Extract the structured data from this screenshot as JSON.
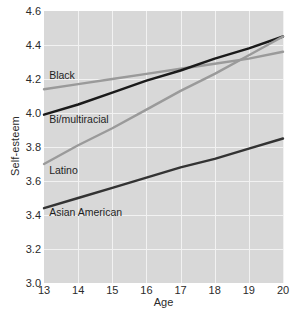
{
  "chart_data": {
    "type": "line",
    "title": "",
    "xlabel": "Age",
    "ylabel": "Self-esteem",
    "x": [
      13,
      14,
      15,
      16,
      17,
      18,
      19,
      20
    ],
    "xlim": [
      13,
      20
    ],
    "ylim": [
      3.0,
      4.6
    ],
    "yticks": [
      "4.6",
      "4.4",
      "4.2",
      "4.0",
      "3.8",
      "3.6",
      "3.4",
      "3.2",
      "3.0"
    ],
    "ytick_values": [
      4.6,
      4.4,
      4.2,
      4.0,
      3.8,
      3.6,
      3.4,
      3.2,
      3.0
    ],
    "xticks": [
      "13",
      "14",
      "15",
      "16",
      "17",
      "18",
      "19",
      "20"
    ],
    "grid": true,
    "legend_position": "inline-labels",
    "plot_background": "#d8d8d8",
    "gridline_color": "#f2f2f2",
    "series": [
      {
        "name": "Black",
        "color": "#9a9a9a",
        "values": [
          4.14,
          4.17,
          4.2,
          4.23,
          4.26,
          4.29,
          4.32,
          4.36
        ],
        "label_x": 14.0,
        "label_y": 4.22
      },
      {
        "name": "Bi/multiracial",
        "color": "#1a1a1a",
        "values": [
          3.99,
          4.05,
          4.12,
          4.19,
          4.25,
          4.32,
          4.38,
          4.45
        ],
        "label_x": 14.0,
        "label_y": 3.96
      },
      {
        "name": "Latino",
        "color": "#9a9a9a",
        "values": [
          3.7,
          3.81,
          3.91,
          4.02,
          4.13,
          4.23,
          4.34,
          4.45
        ],
        "label_x": 14.0,
        "label_y": 3.66
      },
      {
        "name": "Asian American",
        "color": "#333333",
        "values": [
          3.44,
          3.5,
          3.56,
          3.62,
          3.68,
          3.73,
          3.79,
          3.85
        ],
        "label_x": 14.0,
        "label_y": 3.41
      }
    ]
  }
}
